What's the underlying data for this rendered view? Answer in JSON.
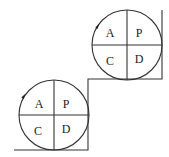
{
  "diagram": {
    "colors": {
      "stroke": "#333333",
      "text": "#222222",
      "background": "#ffffff"
    },
    "cycles": [
      {
        "name": "upper-cycle",
        "cx": 127,
        "cy": 45,
        "r": 35,
        "quadrants": {
          "top_left": "A",
          "top_right": "P",
          "bottom_left": "C",
          "bottom_right": "D"
        }
      },
      {
        "name": "lower-cycle",
        "cx": 54,
        "cy": 115,
        "r": 35,
        "quadrants": {
          "top_left": "A",
          "top_right": "P",
          "bottom_left": "C",
          "bottom_right": "D"
        }
      }
    ],
    "staircase": "14,150 88,150 88,79 162,79 162,10"
  }
}
